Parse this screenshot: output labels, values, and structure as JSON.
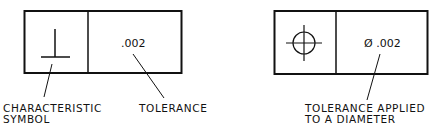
{
  "diagram": {
    "left_frame": {
      "symbol": "perpendicularity-symbol",
      "tolerance_value": ".002",
      "callouts": {
        "symbol_label_line1": "CHARACTERISTIC",
        "symbol_label_line2": "SYMBOL",
        "tolerance_label": "TOLERANCE"
      }
    },
    "right_frame": {
      "symbol": "position-symbol",
      "tolerance_value": "Ø .002",
      "callouts": {
        "tolerance_label_line1": "TOLERANCE APPLIED",
        "tolerance_label_line2": "TO A DIAMETER"
      }
    },
    "colors": {
      "line": "#111111",
      "background": "#ffffff"
    }
  }
}
